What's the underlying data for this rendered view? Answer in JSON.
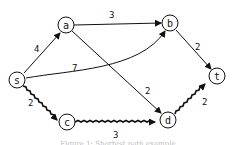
{
  "diagram": {
    "type": "directed-weighted-graph",
    "nodes": [
      {
        "id": "s",
        "label": "s",
        "x": 17,
        "y": 80
      },
      {
        "id": "a",
        "label": "a",
        "x": 66,
        "y": 25
      },
      {
        "id": "b",
        "label": "b",
        "x": 170,
        "y": 23
      },
      {
        "id": "t",
        "label": "t",
        "x": 217,
        "y": 76
      },
      {
        "id": "c",
        "label": "c",
        "x": 67,
        "y": 122
      },
      {
        "id": "d",
        "label": "d",
        "x": 168,
        "y": 120
      }
    ],
    "edges": [
      {
        "from": "s",
        "to": "a",
        "weight": "4",
        "highlighted": false
      },
      {
        "from": "a",
        "to": "b",
        "weight": "3",
        "highlighted": false
      },
      {
        "from": "s",
        "to": "b",
        "weight": "7",
        "highlighted": false
      },
      {
        "from": "a",
        "to": "d",
        "weight": "2",
        "highlighted": false
      },
      {
        "from": "b",
        "to": "t",
        "weight": "2",
        "highlighted": false
      },
      {
        "from": "s",
        "to": "c",
        "weight": "2",
        "highlighted": true
      },
      {
        "from": "c",
        "to": "d",
        "weight": "3",
        "highlighted": true
      },
      {
        "from": "d",
        "to": "t",
        "weight": "2",
        "highlighted": true
      }
    ],
    "caption": "Figure 1: Shortest path example"
  }
}
